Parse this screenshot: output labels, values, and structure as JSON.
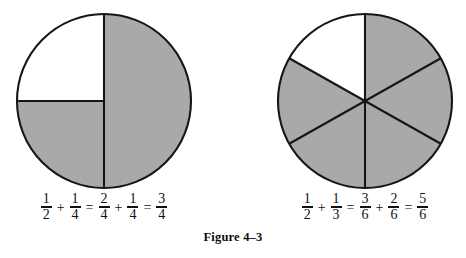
{
  "figure": {
    "caption": "Figure 4–3",
    "colors": {
      "shaded": "#a9a9a9",
      "unshaded": "#ffffff",
      "outline": "#161616",
      "text": "#111111"
    }
  },
  "diagrams": [
    {
      "id": "pie-left",
      "name": "halves-and-quarters-circle",
      "total_parts": 4,
      "shaded_parts": 3,
      "unshaded_parts": 1,
      "part_angle_deg": 90,
      "description": "Circle divided into a right half and two left quarters; right half and lower-left quarter shaded",
      "sectors": [
        {
          "label": "right-half",
          "start_deg": 0,
          "sweep_deg": 180,
          "shaded": true
        },
        {
          "label": "lower-left-quarter",
          "start_deg": 180,
          "sweep_deg": 90,
          "shaded": true
        },
        {
          "label": "upper-left-quarter",
          "start_deg": 270,
          "sweep_deg": 90,
          "shaded": false
        }
      ]
    },
    {
      "id": "pie-right",
      "name": "sixths-circle",
      "total_parts": 6,
      "shaded_parts": 5,
      "unshaded_parts": 1,
      "part_angle_deg": 60,
      "description": "Circle divided into six equal sixths; five shaded, the upper-left sixth unshaded",
      "sectors": [
        {
          "label": "sixth-1",
          "start_deg": 0,
          "sweep_deg": 60,
          "shaded": true
        },
        {
          "label": "sixth-2",
          "start_deg": 60,
          "sweep_deg": 60,
          "shaded": true
        },
        {
          "label": "sixth-3",
          "start_deg": 120,
          "sweep_deg": 60,
          "shaded": true
        },
        {
          "label": "sixth-4",
          "start_deg": 180,
          "sweep_deg": 60,
          "shaded": true
        },
        {
          "label": "sixth-5",
          "start_deg": 240,
          "sweep_deg": 60,
          "shaded": true
        },
        {
          "label": "sixth-6",
          "start_deg": 300,
          "sweep_deg": 60,
          "shaded": false
        }
      ]
    }
  ],
  "equations": {
    "left": {
      "plain_text": "1/2 + 1/4 = 2/4 + 1/4 = 3/4",
      "terms": [
        {
          "num": "1",
          "den": "2"
        },
        {
          "num": "1",
          "den": "4"
        },
        {
          "num": "2",
          "den": "4"
        },
        {
          "num": "1",
          "den": "4"
        },
        {
          "num": "3",
          "den": "4"
        }
      ],
      "operators": {
        "plus": "+",
        "equals": "="
      }
    },
    "right": {
      "plain_text": "1/2 + 1/3 = 3/6 + 2/6 = 5/6",
      "terms": [
        {
          "num": "1",
          "den": "2"
        },
        {
          "num": "1",
          "den": "3"
        },
        {
          "num": "3",
          "den": "6"
        },
        {
          "num": "2",
          "den": "6"
        },
        {
          "num": "5",
          "den": "6"
        }
      ],
      "operators": {
        "plus": "+",
        "equals": "="
      }
    }
  }
}
